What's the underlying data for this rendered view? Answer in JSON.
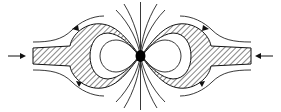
{
  "diagram": {
    "elements": {
      "left_inflow_arrow": "arrow-right",
      "right_inflow_arrow": "arrow-left",
      "center_point": "filled-circle",
      "lobes": [
        "left-hatched-ring",
        "right-hatched-ring"
      ],
      "flow_arrows": [
        "upper-left",
        "lower-left",
        "upper-right",
        "lower-right"
      ]
    },
    "colors": {
      "stroke": "#222222",
      "background": "#ffffff"
    }
  }
}
